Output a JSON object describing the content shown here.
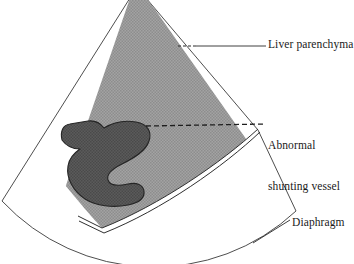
{
  "figure": {
    "type": "medical-illustration",
    "background_color": "#ffffff",
    "line_color": "#333333"
  },
  "regions": {
    "liver_parenchyma": {
      "name": "liver-parenchyma",
      "fill_color": "#9a9a9a",
      "texture": "fine cross-hatch stipple",
      "description": "large hatched wedge occupying upper portion of sector"
    },
    "abnormal_shunting_vessel": {
      "name": "abnormal-shunting-vessel",
      "fill_color": "#555555",
      "texture": "dark dense stipple",
      "description": "S-shaped dark blob inside liver parenchyma"
    },
    "diaphragm": {
      "name": "diaphragm",
      "fill_color": "#ffffff",
      "description": "thin curved band below the liver parenchyma"
    },
    "sector_field": {
      "name": "ultrasound-sector-field",
      "fill_color": "#ffffff",
      "description": "fan-shaped scan field outline, apex cropped at top"
    }
  },
  "annotations": [
    {
      "id": "liver-parenchyma",
      "label": "Liver parenchyma",
      "lines": [
        "Liver parenchyma"
      ],
      "leader": "dashed-then-solid horizontal"
    },
    {
      "id": "abnormal-shunting-vessel",
      "label": "Abnormal shunting vessel",
      "lines": [
        "Abnormal",
        "shunting vessel"
      ],
      "leader": "dashed horizontal"
    },
    {
      "id": "diaphragm",
      "label": "Diaphragm",
      "lines": [
        "Diaphragm"
      ],
      "leader": "solid diagonal"
    }
  ],
  "labels": {
    "liver_parenchyma": "Liver parenchyma",
    "abnormal_line1": "Abnormal",
    "abnormal_line2": "shunting vessel",
    "diaphragm": "Diaphragm"
  }
}
